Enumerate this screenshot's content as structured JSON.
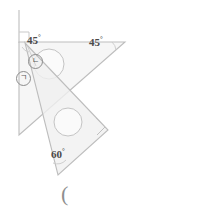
{
  "figure": {
    "background_color": "#ffffff",
    "stroke_color": "#b9b9b9",
    "fill_color": "#f2f2f2",
    "text_color": "#4a4a4a",
    "labels": {
      "angle_45_left": "45",
      "angle_45_right": "45",
      "angle_60": "60",
      "degree_symbol": "°",
      "circled_n": "ㄴ",
      "circled_g": "ㄱ",
      "paren": "("
    },
    "icons": {
      "right_angle_top": "right-angle-mark-icon",
      "right_angle_lower": "right-angle-mark-icon",
      "vertical_reference": "vertical-reference-line-icon"
    },
    "shapes": {
      "triangle_45": {
        "name": "set-square-45-45-90",
        "points": "19,42 125,42 19,135",
        "angles": [
          45,
          45,
          90
        ]
      },
      "triangle_60": {
        "name": "set-square-30-60-90",
        "points": "25,43 108,130 58,175",
        "angles": [
          30,
          60,
          90
        ]
      },
      "hole_45": {
        "cx": 49,
        "cy": 64,
        "r": 15
      },
      "hole_60": {
        "cx": 68,
        "cy": 122,
        "r": 14
      }
    },
    "reference_line": {
      "x": 19,
      "y1": 10,
      "y2": 42
    }
  }
}
